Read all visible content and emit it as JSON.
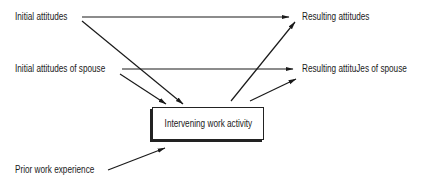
{
  "diagram": {
    "inputs": [
      {
        "id": "initial-attitudes",
        "label": "Initial attitudes"
      },
      {
        "id": "initial-attitudes-spouse",
        "label": "Initial attitudes of spouse"
      },
      {
        "id": "prior-work-experience",
        "label": "Prior work experience"
      }
    ],
    "center": {
      "id": "intervening-work-activity",
      "label": "Intervening work activity"
    },
    "outputs": [
      {
        "id": "resulting-attitudes",
        "label": "Resulting attitudes"
      },
      {
        "id": "resulting-attitudes-spouse",
        "label": "Resulting attituJes of spouse"
      }
    ],
    "edges": [
      {
        "from": "initial-attitudes",
        "to": "resulting-attitudes"
      },
      {
        "from": "initial-attitudes",
        "to": "intervening-work-activity"
      },
      {
        "from": "initial-attitudes-spouse",
        "to": "resulting-attitudes-spouse"
      },
      {
        "from": "initial-attitudes-spouse",
        "to": "intervening-work-activity"
      },
      {
        "from": "prior-work-experience",
        "to": "intervening-work-activity"
      },
      {
        "from": "intervening-work-activity",
        "to": "resulting-attitudes"
      },
      {
        "from": "intervening-work-activity",
        "to": "resulting-attitudes-spouse"
      }
    ]
  }
}
